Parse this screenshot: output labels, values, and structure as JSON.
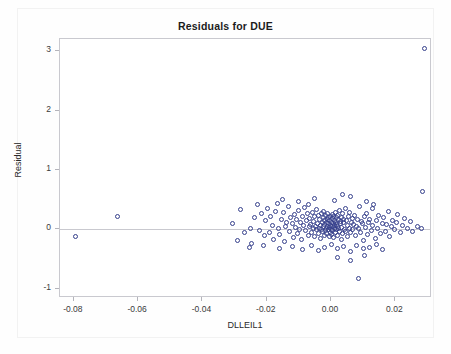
{
  "chart_data": {
    "type": "scatter",
    "title": "Residuals for DUE",
    "xlabel": "DLLEIL1",
    "ylabel": "Residual",
    "xlim": [
      -0.0843,
      0.0314
    ],
    "ylim": [
      -1.16,
      3.21
    ],
    "grid": false,
    "legend": null,
    "xticks": [
      -0.08,
      -0.06,
      -0.04,
      -0.02,
      0.0,
      0.02
    ],
    "xticklabels": [
      "-0.08",
      "-0.06",
      "-0.04",
      "-0.02",
      "0.00",
      "0.02"
    ],
    "yticks": [
      -1,
      0,
      1,
      2,
      3
    ],
    "yticklabels": [
      "-1",
      "0",
      "1",
      "2",
      "3"
    ],
    "reference_line": {
      "orientation": "horizontal",
      "value": 0
    },
    "marker": {
      "style": "open-circle",
      "color": "#36408c",
      "size": 5
    },
    "series": [
      {
        "name": "Residuals",
        "points": [
          [
            -0.0795,
            -0.12
          ],
          [
            -0.0665,
            0.21
          ],
          [
            -0.0305,
            0.1
          ],
          [
            -0.0292,
            -0.19
          ],
          [
            -0.0282,
            0.33
          ],
          [
            -0.0268,
            -0.06
          ],
          [
            -0.0252,
            0.02
          ],
          [
            -0.0246,
            -0.24
          ],
          [
            -0.0238,
            0.19
          ],
          [
            -0.0229,
            0.41
          ],
          [
            -0.0222,
            -0.02
          ],
          [
            -0.0215,
            0.27
          ],
          [
            -0.0208,
            -0.11
          ],
          [
            -0.0203,
            0.14
          ],
          [
            -0.0197,
            0.35
          ],
          [
            -0.0192,
            -0.05
          ],
          [
            -0.0188,
            0.22
          ],
          [
            -0.0182,
            0.07
          ],
          [
            -0.0178,
            -0.17
          ],
          [
            -0.0173,
            0.3
          ],
          [
            -0.0168,
            0.44
          ],
          [
            -0.0163,
            0.01
          ],
          [
            -0.0159,
            -0.09
          ],
          [
            -0.0154,
            0.17
          ],
          [
            -0.0149,
            0.28
          ],
          [
            -0.0145,
            -0.21
          ],
          [
            -0.0141,
            0.05
          ],
          [
            -0.0137,
            0.12
          ],
          [
            -0.0133,
            0.38
          ],
          [
            -0.0129,
            -0.03
          ],
          [
            -0.0125,
            0.2
          ],
          [
            -0.0121,
            0.09
          ],
          [
            -0.0118,
            -0.14
          ],
          [
            -0.0114,
            0.25
          ],
          [
            -0.011,
            0.03
          ],
          [
            -0.0107,
            0.16
          ],
          [
            -0.0104,
            -0.07
          ],
          [
            -0.01,
            0.31
          ],
          [
            -0.0097,
            0.0
          ],
          [
            -0.0094,
            0.11
          ],
          [
            -0.0091,
            -0.18
          ],
          [
            -0.0088,
            0.22
          ],
          [
            -0.0085,
            0.06
          ],
          [
            -0.0082,
            0.36
          ],
          [
            -0.0079,
            -0.02
          ],
          [
            -0.0076,
            0.14
          ],
          [
            -0.0073,
            0.26
          ],
          [
            -0.0071,
            -0.1
          ],
          [
            -0.0068,
            0.04
          ],
          [
            -0.0066,
            0.18
          ],
          [
            -0.0063,
            0.08
          ],
          [
            -0.0061,
            -0.05
          ],
          [
            -0.0058,
            0.29
          ],
          [
            -0.0056,
            0.01
          ],
          [
            -0.0054,
            0.13
          ],
          [
            -0.0052,
            -0.13
          ],
          [
            -0.005,
            0.21
          ],
          [
            -0.0048,
            0.05
          ],
          [
            -0.0046,
            0.33
          ],
          [
            -0.0044,
            -0.01
          ],
          [
            -0.0042,
            0.1
          ],
          [
            -0.004,
            0.24
          ],
          [
            -0.0039,
            -0.08
          ],
          [
            -0.0037,
            0.02
          ],
          [
            -0.0035,
            0.16
          ],
          [
            -0.0034,
            0.07
          ],
          [
            -0.0032,
            -0.16
          ],
          [
            -0.0031,
            0.27
          ],
          [
            -0.0029,
            0.0
          ],
          [
            -0.0028,
            0.12
          ],
          [
            -0.0026,
            -0.04
          ],
          [
            -0.0025,
            0.19
          ],
          [
            -0.0024,
            0.04
          ],
          [
            -0.0022,
            0.3
          ],
          [
            -0.0021,
            -0.11
          ],
          [
            -0.002,
            0.08
          ],
          [
            -0.0019,
            0.15
          ],
          [
            -0.0017,
            -0.02
          ],
          [
            -0.0016,
            0.23
          ],
          [
            -0.0015,
            0.01
          ],
          [
            -0.0014,
            0.11
          ],
          [
            -0.0013,
            -0.07
          ],
          [
            -0.0012,
            0.17
          ],
          [
            -0.0011,
            0.05
          ],
          [
            -0.001,
            0.26
          ],
          [
            -0.0009,
            -0.01
          ],
          [
            -0.0008,
            0.09
          ],
          [
            -0.0007,
            0.2
          ],
          [
            -0.0006,
            -0.12
          ],
          [
            -0.0005,
            0.03
          ],
          [
            -0.0004,
            0.14
          ],
          [
            -0.0003,
            0.06
          ],
          [
            -0.0002,
            -0.05
          ],
          [
            -0.0001,
            0.22
          ],
          [
            0.0,
            0.0
          ],
          [
            0.0001,
            0.12
          ],
          [
            0.0002,
            -0.09
          ],
          [
            0.0003,
            0.18
          ],
          [
            0.0004,
            0.04
          ],
          [
            0.0005,
            0.25
          ],
          [
            0.0006,
            -0.02
          ],
          [
            0.0007,
            0.1
          ],
          [
            0.0008,
            0.21
          ],
          [
            0.0009,
            -0.14
          ],
          [
            0.001,
            0.07
          ],
          [
            0.0011,
            0.15
          ],
          [
            0.0012,
            0.02
          ],
          [
            0.0013,
            0.28
          ],
          [
            0.0014,
            -0.06
          ],
          [
            0.0015,
            0.11
          ],
          [
            0.0016,
            0.19
          ],
          [
            0.0017,
            -0.01
          ],
          [
            0.0018,
            0.08
          ],
          [
            0.0019,
            0.23
          ],
          [
            0.002,
            -0.1
          ],
          [
            0.0021,
            0.05
          ],
          [
            0.0022,
            0.16
          ],
          [
            0.0024,
            0.01
          ],
          [
            0.0025,
            0.31
          ],
          [
            0.0026,
            -0.04
          ],
          [
            0.0028,
            0.13
          ],
          [
            0.0029,
            0.09
          ],
          [
            0.0031,
            -0.17
          ],
          [
            0.0032,
            0.2
          ],
          [
            0.0034,
            0.03
          ],
          [
            0.0035,
            0.26
          ],
          [
            0.0037,
            -0.08
          ],
          [
            0.0039,
            0.11
          ],
          [
            0.004,
            0.17
          ],
          [
            0.0042,
            0.0
          ],
          [
            0.0044,
            0.35
          ],
          [
            0.0046,
            -0.03
          ],
          [
            0.0048,
            0.14
          ],
          [
            0.005,
            0.07
          ],
          [
            0.0052,
            -0.13
          ],
          [
            0.0054,
            0.22
          ],
          [
            0.0056,
            0.02
          ],
          [
            0.0058,
            0.29
          ],
          [
            0.0061,
            -0.06
          ],
          [
            0.0063,
            0.12
          ],
          [
            0.0066,
            0.18
          ],
          [
            0.0068,
            -0.01
          ],
          [
            0.0071,
            0.08
          ],
          [
            0.0073,
            0.24
          ],
          [
            0.0076,
            -0.11
          ],
          [
            0.0079,
            0.05
          ],
          [
            0.0082,
            0.16
          ],
          [
            0.0085,
            0.01
          ],
          [
            0.0088,
            0.38
          ],
          [
            0.0091,
            -0.05
          ],
          [
            0.0094,
            0.13
          ],
          [
            0.0097,
            0.09
          ],
          [
            0.01,
            -0.19
          ],
          [
            0.0104,
            0.21
          ],
          [
            0.0107,
            0.03
          ],
          [
            0.011,
            0.27
          ],
          [
            0.0114,
            -0.09
          ],
          [
            0.0118,
            0.11
          ],
          [
            0.0121,
            0.17
          ],
          [
            0.0125,
            -0.02
          ],
          [
            0.0129,
            0.06
          ],
          [
            0.0133,
            0.42
          ],
          [
            0.0137,
            -0.15
          ],
          [
            0.0141,
            0.14
          ],
          [
            0.0145,
            0.02
          ],
          [
            0.0149,
            0.23
          ],
          [
            0.0154,
            -0.07
          ],
          [
            0.0159,
            0.1
          ],
          [
            0.0163,
            0.19
          ],
          [
            0.0168,
            -0.04
          ],
          [
            0.0173,
            0.08
          ],
          [
            0.0178,
            0.3
          ],
          [
            0.0182,
            -0.12
          ],
          [
            0.0188,
            0.04
          ],
          [
            0.0192,
            0.15
          ],
          [
            0.0197,
            -0.01
          ],
          [
            0.0203,
            0.12
          ],
          [
            0.0208,
            0.25
          ],
          [
            0.0215,
            -0.06
          ],
          [
            0.0222,
            0.07
          ],
          [
            0.0229,
            0.18
          ],
          [
            0.0238,
            0.02
          ],
          [
            0.0246,
            0.13
          ],
          [
            0.0252,
            -0.03
          ],
          [
            0.0268,
            0.05
          ],
          [
            0.0282,
            0.01
          ],
          [
            0.0285,
            0.63
          ],
          [
            0.029,
            3.05
          ],
          [
            -0.0254,
            -0.3
          ],
          [
            -0.021,
            -0.27
          ],
          [
            -0.016,
            -0.32
          ],
          [
            -0.012,
            -0.29
          ],
          [
            -0.009,
            -0.34
          ],
          [
            -0.006,
            -0.28
          ],
          [
            -0.004,
            -0.36
          ],
          [
            -0.002,
            -0.31
          ],
          [
            0.0,
            -0.26
          ],
          [
            0.002,
            -0.33
          ],
          [
            0.004,
            -0.29
          ],
          [
            0.006,
            -0.38
          ],
          [
            0.008,
            -0.27
          ],
          [
            0.01,
            -0.32
          ],
          [
            0.012,
            -0.3
          ],
          [
            0.014,
            -0.25
          ],
          [
            0.016,
            -0.34
          ],
          [
            0.006,
            -0.52
          ],
          [
            0.002,
            -0.48
          ],
          [
            0.0105,
            -0.45
          ],
          [
            0.0085,
            -0.83
          ],
          [
            -0.015,
            0.5
          ],
          [
            -0.01,
            0.46
          ],
          [
            -0.005,
            0.52
          ],
          [
            0.001,
            0.48
          ],
          [
            0.006,
            0.55
          ],
          [
            0.011,
            0.47
          ],
          [
            0.0035,
            0.58
          ],
          [
            0.013,
            0.35
          ],
          [
            -0.007,
            0.42
          ]
        ]
      }
    ]
  },
  "axes": {
    "x_label": "DLLEIL1",
    "y_label": "Residual"
  }
}
